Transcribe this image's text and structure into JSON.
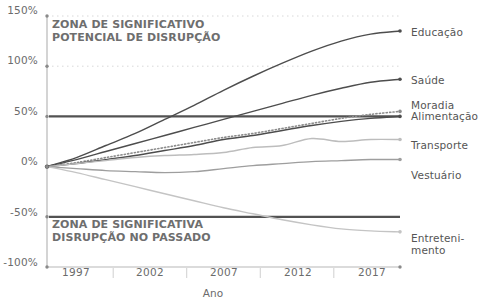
{
  "chart_data": {
    "type": "line",
    "title": "",
    "xlabel": "Ano",
    "ylabel": "",
    "ylim": [
      -100,
      150
    ],
    "xlim": [
      1995,
      2019
    ],
    "grid": true,
    "legend_position": "right-end-labels",
    "ytick_labels": [
      "150%",
      "100%",
      "50%",
      "0%",
      "-50%",
      "-100%"
    ],
    "ytick_values": [
      150,
      100,
      50,
      0,
      -50,
      -100
    ],
    "xtick_labels": [
      "1997",
      "2002",
      "2007",
      "2012",
      "2017"
    ],
    "xtick_values": [
      1997,
      2002,
      2007,
      2012,
      2017
    ],
    "reference_lines": [
      {
        "value": 50,
        "name": "limiar-superior"
      },
      {
        "value": -50,
        "name": "limiar-inferior"
      }
    ],
    "annotations": [
      {
        "name": "zona-potencial-disrupcao",
        "text": "ZONA DE SIGNIFICATIVO\nPOTENCIAL DE DISRUPÇÃO",
        "x": 1996.2,
        "y": 140
      },
      {
        "name": "zona-disrupcao-passado",
        "text": "ZONA DE SIGNIFICATIVA\nDISRUPÇÃO NO PASSADO",
        "x": 1996.2,
        "y": -62
      }
    ],
    "x": [
      1995,
      1997,
      1999,
      2001,
      2003,
      2005,
      2007,
      2009,
      2011,
      2013,
      2015,
      2017,
      2019
    ],
    "series": [
      {
        "name": "Educação",
        "label": "Educação",
        "color": "#4d4d4d",
        "style": "solid",
        "width": 1.4,
        "values": [
          0,
          9,
          21,
          33,
          47,
          61,
          76,
          90,
          103,
          115,
          125,
          132,
          135
        ]
      },
      {
        "name": "Saúde",
        "label": "Saúde",
        "color": "#4d4d4d",
        "style": "solid",
        "width": 1.4,
        "values": [
          0,
          7,
          15,
          23,
          31,
          39,
          47,
          55,
          63,
          71,
          78,
          84,
          87
        ]
      },
      {
        "name": "Moradia",
        "label": "Moradia",
        "color": "#8c8c8c",
        "style": "dotted",
        "width": 1.6,
        "values": [
          0,
          4,
          9,
          14,
          19,
          24,
          29,
          33,
          38,
          43,
          48,
          52,
          55
        ]
      },
      {
        "name": "Alimentação",
        "label": "Alimentação",
        "color": "#4d4d4d",
        "style": "solid",
        "width": 1.4,
        "values": [
          0,
          3,
          7,
          11,
          16,
          21,
          27,
          31,
          36,
          41,
          45,
          48,
          50
        ]
      },
      {
        "name": "Transporte",
        "label": "Transporte",
        "color": "#bdbdbd",
        "style": "solid",
        "width": 1.4,
        "values": [
          0,
          3,
          6,
          9,
          11,
          12,
          14,
          19,
          21,
          28,
          25,
          27,
          27
        ]
      },
      {
        "name": "Vestuário",
        "label": "Vestuário",
        "color": "#9e9e9e",
        "style": "solid",
        "width": 1.4,
        "values": [
          0,
          -2,
          -4,
          -5,
          -6,
          -5,
          -2,
          1,
          3,
          5,
          6,
          7,
          7
        ]
      },
      {
        "name": "Entretenimento",
        "label": "Entreteni-\nmento",
        "color": "#c4c4c4",
        "style": "solid",
        "width": 1.4,
        "values": [
          0,
          -6,
          -13,
          -20,
          -27,
          -34,
          -41,
          -47,
          -53,
          -58,
          -62,
          -64,
          -65
        ]
      }
    ]
  },
  "axes": {
    "y_ticks": [
      {
        "label": "150%",
        "top": 10
      },
      {
        "label": "100%",
        "top": 60
      },
      {
        "label": "50%",
        "top": 111
      },
      {
        "label": "0%",
        "top": 161
      },
      {
        "label": "-50%",
        "top": 212
      },
      {
        "label": "-100%",
        "top": 262
      }
    ],
    "x_ticks": [
      {
        "label": "1997",
        "left": 40
      },
      {
        "label": "1997_c",
        "left": 0
      }
    ],
    "x_tick_labels": [
      {
        "label": "1997",
        "left": 39
      },
      {
        "label": "2002",
        "left": 113
      },
      {
        "label": "2007",
        "left": 187
      },
      {
        "label": "2012",
        "left": 261
      },
      {
        "label": "2017",
        "left": 335
      }
    ],
    "x_axis_title": "Ano"
  },
  "zones": {
    "upper": "ZONA DE SIGNIFICATIVO\nPOTENCIAL DE DISRUPÇÃO",
    "lower": "ZONA DE SIGNIFICATIVA\nDISRUPÇÃO NO PASSADO"
  },
  "end_labels": [
    {
      "name": "Educação",
      "text": "Educação",
      "top": 26
    },
    {
      "name": "Saúde",
      "text": "Saúde",
      "top": 74
    },
    {
      "name": "Moradia",
      "text": "Moradia",
      "top": 99
    },
    {
      "name": "Alimentação",
      "text": "Alimentação",
      "top": 110
    },
    {
      "name": "Transporte",
      "text": "Transporte",
      "top": 139
    },
    {
      "name": "Vestuário",
      "text": "Vestuário",
      "top": 169
    },
    {
      "name": "Entretenimento",
      "text": "Entreteni-\nmento",
      "top": 232
    }
  ],
  "topstrip": ""
}
